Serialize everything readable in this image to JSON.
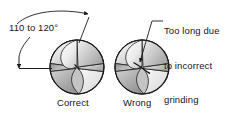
{
  "figure": {
    "background_color": "#ffffff",
    "line_color": "#1a1a1a",
    "text_color": "#161616"
  },
  "annotations": {
    "angle_label": "110 to 120°",
    "grinding_note_line1": "Too long due",
    "grinding_note_line2": "to incorrect",
    "grinding_note_line3": "grinding"
  },
  "captions": {
    "correct": "Correct",
    "wrong": "Wrong"
  },
  "drills": [
    {
      "name": "correct-drill-point",
      "caption": "Correct",
      "center_x": 77,
      "center_y": 67,
      "radius": 27
    },
    {
      "name": "wrong-drill-point",
      "caption": "Wrong",
      "center_x": 142,
      "center_y": 67,
      "radius": 27
    }
  ],
  "colors": {
    "shade_light": "#f0f0f0",
    "shade_mid": "#c9c9c9",
    "shade_dark": "#9a9a9a",
    "outline": "#1a1a1a"
  }
}
